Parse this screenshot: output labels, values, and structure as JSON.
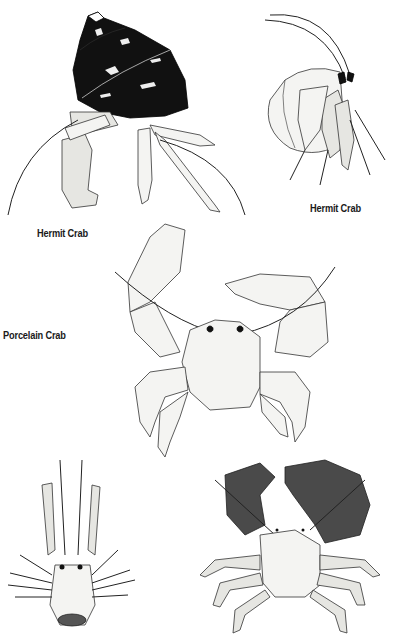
{
  "page": {
    "background": "#ffffff",
    "ink_color": "#1a1a1a"
  },
  "labels": {
    "hermit_crab_left": "Hermit Crab",
    "hermit_crab_right": "Hermit Crab",
    "porcelain_crab": "Porcelain Crab"
  },
  "figures": [
    {
      "id": "hermit-crab-shell-dark",
      "caption_key": "hermit_crab_left"
    },
    {
      "id": "hermit-crab-shell-pale",
      "caption_key": "hermit_crab_right"
    },
    {
      "id": "porcelain-crab-large",
      "caption_key": "porcelain_crab"
    },
    {
      "id": "squat-lobster-top-view",
      "caption_key": null
    },
    {
      "id": "porcelain-crab-dark-claws",
      "caption_key": null
    }
  ]
}
